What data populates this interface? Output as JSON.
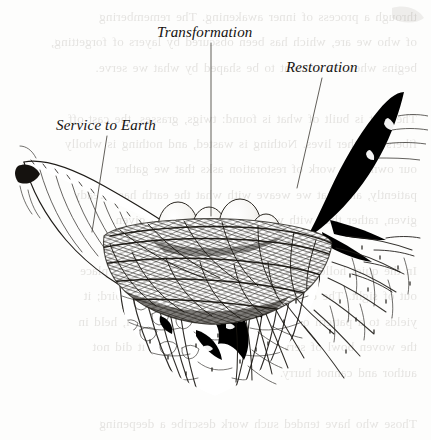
{
  "page": {
    "width": 431,
    "height": 440,
    "background_color": "#fdfdfc",
    "ink_color": "#14110f",
    "bleedthrough_color": "#6a6258",
    "media": "pen-and-ink illustration on book page with verso show-through"
  },
  "figure": {
    "caption_style": "italic serif labels with thin leader lines"
  },
  "labels": [
    {
      "id": "transformation",
      "text": "Transformation",
      "points_to": "eggs at center of nest",
      "leader": {
        "x1": 211,
        "y1": 43,
        "x2": 211,
        "y2": 216
      }
    },
    {
      "id": "restoration",
      "text": "Restoration",
      "points_to": "right rim of nest beneath black feather",
      "leader": {
        "x1": 322,
        "y1": 78,
        "x2": 297,
        "y2": 188
      }
    },
    {
      "id": "service_to_earth",
      "text": "Service to Earth",
      "points_to": "left rim of nest and supporting forms",
      "leader": {
        "x1": 107,
        "y1": 136,
        "x2": 92,
        "y2": 232
      }
    }
  ],
  "illustration_elements": {
    "eggs": {
      "count": 4,
      "description": "pale ovoid eggs resting in the nest cup"
    },
    "nest": {
      "description": "densely woven twig and grass bowl"
    },
    "black_feather": {
      "description": "solid black feather rising along the right edge"
    },
    "left_wing": {
      "description": "pale feather sweeping down from upper left"
    },
    "roots": {
      "description": "radiating root-like tendrils fanning below the bowl"
    }
  },
  "bleedthrough_text": "through a process of inner awakening. The remembering\nof who we are, which has been obscured by layers of forgetting,\nbegins when we consent to be shaped by what we serve.\n\nThe nest is built of what is found: twigs, grasses, the cast-off\nfibers of other lives. Nothing is wasted, and nothing is wholly\nour own. The work of restoration asks that we gather\npatiently, and that we weave with what the earth has already\ngiven, rather than with what we wish had been given.\n\nIn the quiet hollow at the center, transformation takes place\nout of sight. The egg does not labor to become the bird; it\nyields to a pattern older than itself. So too the soul, held in\nthe woven bowl of service, is altered by forces it did not\nauthor and cannot hurry.\n\nThose who have tended such work describe a deepening\nrather than an ascent — a sinking of roots into dark and\nnourishing ground. The feather that lifts is the same\nsubstance as the root that holds. Flight and rootedness are\nnot opposites but the two motions of a single life, and the\nnest is the place where they are reconciled to one another."
}
